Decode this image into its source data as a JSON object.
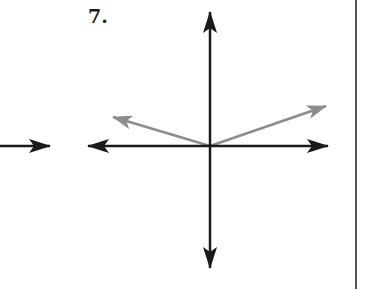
{
  "problem": {
    "number_label": "7."
  },
  "colors": {
    "axis": "#1a1a1a",
    "vector": "#8c8c8c",
    "divider": "#555555",
    "background": "#ffffff"
  },
  "diagram": {
    "origin": [
      210,
      146
    ],
    "axes": {
      "vertical": {
        "top_tip": [
          210,
          12
        ],
        "bottom_tip": [
          210,
          268
        ]
      },
      "horizontal": {
        "left_tip": [
          88,
          146
        ],
        "right_tip": [
          328,
          146
        ]
      }
    },
    "left_fragment_arrow": {
      "from": [
        0,
        146
      ],
      "to": [
        50,
        146
      ],
      "direction": "right"
    },
    "vectors": [
      {
        "name": "vector-up-left",
        "from": [
          210,
          146
        ],
        "to": [
          113,
          117
        ],
        "color": "gray"
      },
      {
        "name": "vector-up-right",
        "from": [
          210,
          146
        ],
        "to": [
          326,
          106
        ],
        "color": "gray"
      }
    ]
  }
}
